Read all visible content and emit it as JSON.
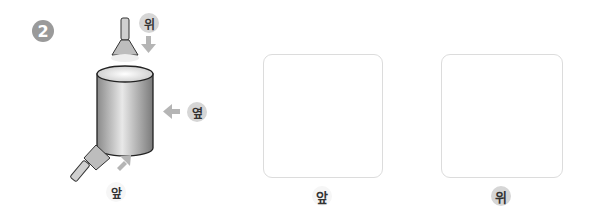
{
  "problem": {
    "number": "2",
    "direction_labels": {
      "top": "위",
      "side": "옆",
      "front": "앞"
    }
  },
  "answer_boxes": [
    {
      "label": "앞"
    },
    {
      "label": "위"
    }
  ],
  "colors": {
    "badge": "#9a9a9a",
    "arrow": "#b5b5b5",
    "box_border": "#dcdcdc",
    "chip_gray": "#d6d6d6"
  }
}
